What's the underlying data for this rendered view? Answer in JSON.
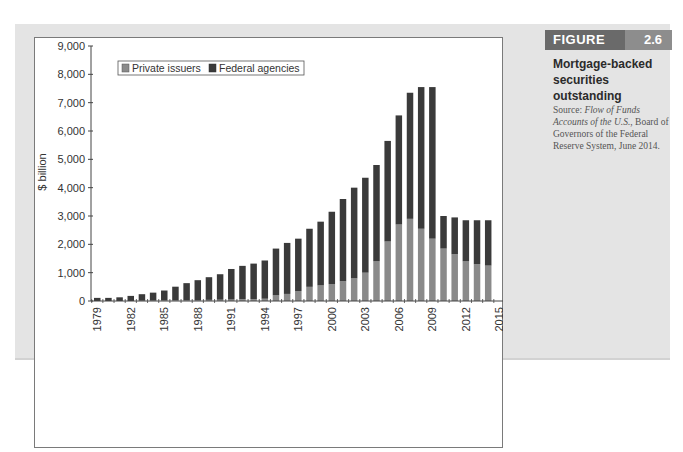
{
  "figure": {
    "label": "FIGURE",
    "number": "2.6",
    "title": "Mortgage-backed securities outstanding",
    "source_prefix": "Source: ",
    "source_italic": "Flow of Funds Accounts of the U.S.",
    "source_suffix": ", Board of Governors of the Federal Reserve System, June 2014."
  },
  "colors": {
    "private_issuers": "#8a8a8a",
    "federal_agencies": "#3a3a3a",
    "panel_bg": "#e4e4e4",
    "figure_tag_dark": "#6a6a6a",
    "figure_tag_light": "#8d8d8d"
  },
  "chart_data": {
    "type": "bar",
    "stacked": true,
    "title": "Mortgage-backed securities outstanding",
    "xlabel": "",
    "ylabel": "$ billion",
    "ylim": [
      0,
      9000
    ],
    "yticks": [
      0,
      1000,
      2000,
      3000,
      4000,
      5000,
      6000,
      7000,
      8000,
      9000
    ],
    "ytick_labels": [
      "0",
      "1,000",
      "2,000",
      "3,000",
      "4,000",
      "5,000",
      "6,000",
      "7,000",
      "8,000",
      "9,000"
    ],
    "xtick_labels": [
      "1979",
      "1982",
      "1985",
      "1988",
      "1991",
      "1994",
      "1997",
      "2000",
      "2003",
      "2006",
      "2009",
      "2012",
      "2015"
    ],
    "legend": [
      "Private issuers",
      "Federal agencies"
    ],
    "legend_position": "top-left",
    "grid": false,
    "categories": [
      "1979",
      "1980",
      "1981",
      "1982",
      "1983",
      "1984",
      "1985",
      "1986",
      "1987",
      "1988",
      "1989",
      "1990",
      "1991",
      "1992",
      "1993",
      "1994",
      "1995",
      "1996",
      "1997",
      "1998",
      "1999",
      "2000",
      "2001",
      "2002",
      "2003",
      "2004",
      "2005",
      "2006",
      "2007",
      "2008",
      "2009",
      "2010",
      "2011",
      "2012",
      "2013",
      "2014"
    ],
    "series": [
      {
        "name": "Private issuers",
        "values": [
          0,
          0,
          0,
          0,
          10,
          15,
          20,
          25,
          30,
          35,
          40,
          45,
          50,
          60,
          70,
          80,
          200,
          250,
          350,
          500,
          550,
          600,
          700,
          800,
          1000,
          1400,
          2100,
          2700,
          2900,
          2550,
          2200,
          1850,
          1650,
          1400,
          1300,
          1250
        ]
      },
      {
        "name": "Federal agencies",
        "values": [
          110,
          110,
          130,
          180,
          230,
          280,
          350,
          480,
          600,
          700,
          800,
          900,
          1080,
          1180,
          1250,
          1350,
          1650,
          1800,
          1850,
          2050,
          2250,
          2550,
          2900,
          3200,
          3350,
          3400,
          3550,
          3850,
          4450,
          5000,
          5350,
          1150,
          1300,
          1450,
          1550,
          1600
        ]
      }
    ],
    "totals": [
      110,
      110,
      130,
      180,
      240,
      295,
      370,
      505,
      630,
      735,
      840,
      945,
      1130,
      1240,
      1320,
      1430,
      1850,
      2050,
      2200,
      2550,
      2800,
      3150,
      3600,
      4000,
      4350,
      4800,
      5650,
      6550,
      7350,
      7550,
      7550,
      3000,
      2950,
      2850,
      2850,
      2850
    ]
  }
}
